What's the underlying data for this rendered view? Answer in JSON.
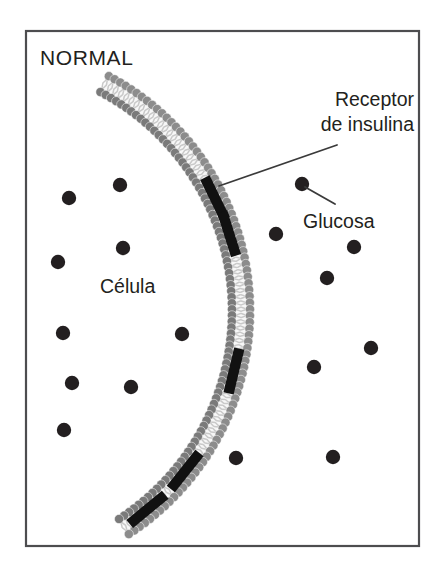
{
  "figure": {
    "title": "NORMAL",
    "kind": "cell-membrane-insulin-receptor-diagram",
    "language": "es",
    "frame": {
      "x": 26,
      "y": 31,
      "width": 393,
      "height": 515,
      "stroke_color": "#4d4d4f",
      "stroke_width": 2.2,
      "fill_color": "#ffffff"
    },
    "colors": {
      "background": "#ffffff",
      "text": "#231f20",
      "frame_stroke": "#4d4d4f",
      "membrane_head": "#8c8c8c",
      "membrane_head_dark": "#7a7a7a",
      "membrane_tail": "#c9c9c9",
      "membrane_fill": "#f7f7f7",
      "receptor": "#111111",
      "glucose": "#231f20",
      "leader_line": "#3a3a3a"
    },
    "labels": [
      {
        "id": "title",
        "name": "normal-title",
        "text": "NORMAL",
        "x": 40,
        "y": 65,
        "anchor": "start",
        "style": "title-text"
      },
      {
        "id": "receptor",
        "name": "receptor-label",
        "lines": [
          "Receptor",
          "de insulina"
        ],
        "x": 414,
        "y": 106,
        "line_height": 25,
        "anchor": "end",
        "style": "annot-text",
        "leader": {
          "x1": 337,
          "y1": 145,
          "x2": 219,
          "y2": 186
        }
      },
      {
        "id": "glucosa",
        "name": "glucosa-label",
        "text": "Glucosa",
        "x": 303,
        "y": 228,
        "anchor": "start",
        "style": "annot-text",
        "leader": {
          "x1": 335,
          "y1": 204,
          "x2": 305,
          "y2": 187
        }
      },
      {
        "id": "celula",
        "name": "celula-label",
        "text": "Célula",
        "x": 100,
        "y": 293,
        "anchor": "start",
        "style": "inner-text"
      }
    ],
    "membrane": {
      "description": "phospholipid bilayer arc forming the cell boundary, convex toward the right",
      "center_x": -16,
      "center_y": 311,
      "inner_radius": 248,
      "outer_radius": 266,
      "start_angle_deg": -62,
      "end_angle_deg": 57,
      "head_radius": 4.6,
      "lipid_count": 86
    },
    "receptors": [
      {
        "name": "receptor-bar-1",
        "angle_deg": -26.0,
        "length": 46,
        "thickness": 10.5
      },
      {
        "name": "receptor-bar-2",
        "angle_deg": -17.5,
        "length": 46,
        "thickness": 10.5
      },
      {
        "name": "receptor-bar-3",
        "angle_deg": 13.5,
        "length": 46,
        "thickness": 10.5
      },
      {
        "name": "receptor-bar-4",
        "angle_deg": 38.5,
        "length": 46,
        "thickness": 10.5
      },
      {
        "name": "receptor-bar-5",
        "angle_deg": 50.5,
        "length": 46,
        "thickness": 10.5
      }
    ],
    "glucose_inside": [
      {
        "x": 120,
        "y": 185
      },
      {
        "x": 69,
        "y": 198
      },
      {
        "x": 123,
        "y": 248
      },
      {
        "x": 58,
        "y": 262
      },
      {
        "x": 63,
        "y": 333
      },
      {
        "x": 182,
        "y": 334
      },
      {
        "x": 72,
        "y": 383
      },
      {
        "x": 131,
        "y": 387
      },
      {
        "x": 64,
        "y": 430
      }
    ],
    "glucose_outside": [
      {
        "x": 302,
        "y": 184
      },
      {
        "x": 276,
        "y": 234
      },
      {
        "x": 354,
        "y": 247
      },
      {
        "x": 327,
        "y": 278
      },
      {
        "x": 371,
        "y": 348
      },
      {
        "x": 314,
        "y": 367
      },
      {
        "x": 236,
        "y": 458
      },
      {
        "x": 333,
        "y": 457
      }
    ],
    "glucose_radius": 7.2
  }
}
